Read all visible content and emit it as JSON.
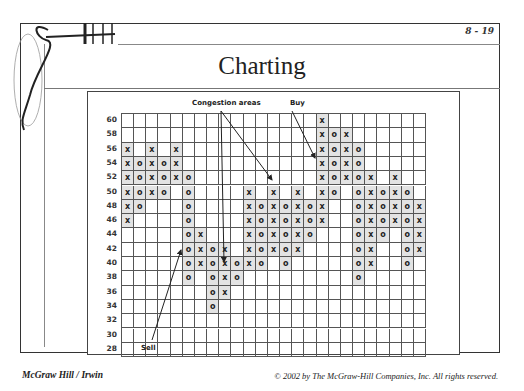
{
  "slide": {
    "page_number": "8 - 19",
    "title": "Charting",
    "footer_left": "McGraw Hill / Irwin",
    "footer_right": "© 2002 by The McGraw-Hill Companies, Inc. All rights reserved."
  },
  "annotations": {
    "congestion": "Congestion areas",
    "buy": "Buy",
    "sell": "Sell"
  },
  "chart_data": {
    "type": "table",
    "y_ticks": [
      60,
      58,
      56,
      54,
      52,
      50,
      48,
      46,
      44,
      42,
      40,
      38,
      36,
      34,
      32,
      30,
      28
    ],
    "columns": 25,
    "grid": true,
    "columns_data": [
      {
        "col": 1,
        "mark": "X",
        "prices": [
          56,
          54,
          52,
          50,
          48,
          46
        ]
      },
      {
        "col": 2,
        "mark": "O",
        "prices": [
          54,
          52,
          50,
          48
        ]
      },
      {
        "col": 3,
        "mark": "X",
        "prices": [
          56,
          54,
          52,
          50
        ]
      },
      {
        "col": 4,
        "mark": "O",
        "prices": [
          54,
          52,
          50
        ]
      },
      {
        "col": 5,
        "mark": "X",
        "prices": [
          56,
          54,
          52
        ]
      },
      {
        "col": 6,
        "mark": "O",
        "prices": [
          52,
          50,
          48,
          46,
          44,
          42,
          40,
          38
        ]
      },
      {
        "col": 7,
        "mark": "X",
        "prices": [
          44,
          42,
          40
        ]
      },
      {
        "col": 8,
        "mark": "O",
        "prices": [
          42,
          40,
          38,
          36,
          34
        ]
      },
      {
        "col": 9,
        "mark": "X",
        "prices": [
          42,
          40,
          38,
          36
        ]
      },
      {
        "col": 10,
        "mark": "O",
        "prices": [
          40,
          38
        ]
      },
      {
        "col": 11,
        "mark": "X",
        "prices": [
          50,
          48,
          46,
          44,
          42,
          40
        ]
      },
      {
        "col": 12,
        "mark": "O",
        "prices": [
          48,
          46,
          44,
          42,
          40
        ]
      },
      {
        "col": 13,
        "mark": "X",
        "prices": [
          50,
          48,
          46,
          44,
          42
        ]
      },
      {
        "col": 14,
        "mark": "O",
        "prices": [
          48,
          46,
          44,
          42,
          40
        ]
      },
      {
        "col": 15,
        "mark": "X",
        "prices": [
          50,
          48,
          46,
          44,
          42
        ]
      },
      {
        "col": 16,
        "mark": "O",
        "prices": [
          48,
          46,
          44
        ]
      },
      {
        "col": 17,
        "mark": "X",
        "prices": [
          60,
          58,
          56,
          54,
          52,
          50,
          48,
          46
        ]
      },
      {
        "col": 18,
        "mark": "O",
        "prices": [
          58,
          56,
          54,
          52,
          50
        ]
      },
      {
        "col": 19,
        "mark": "X",
        "prices": [
          58,
          56,
          54,
          52
        ]
      },
      {
        "col": 20,
        "mark": "O",
        "prices": [
          56,
          54,
          52,
          50,
          48,
          46,
          44,
          42,
          40,
          38
        ]
      },
      {
        "col": 21,
        "mark": "X",
        "prices": [
          52,
          50,
          48,
          46,
          44,
          42,
          40
        ]
      },
      {
        "col": 22,
        "mark": "O",
        "prices": [
          50,
          48,
          46,
          44
        ]
      },
      {
        "col": 23,
        "mark": "X",
        "prices": [
          52,
          50,
          48,
          46
        ]
      },
      {
        "col": 24,
        "mark": "O",
        "prices": [
          50,
          48,
          46,
          44,
          42,
          40
        ]
      },
      {
        "col": 25,
        "mark": "X",
        "prices": [
          48,
          46,
          44,
          42
        ]
      }
    ],
    "annotations": [
      "Congestion areas",
      "Buy",
      "Sell"
    ]
  }
}
